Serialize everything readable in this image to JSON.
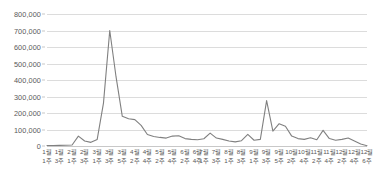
{
  "chart_data": {
    "type": "line",
    "title": "",
    "subtitle": "",
    "xlabel": "",
    "ylabel": "",
    "ylim": [
      0,
      800000
    ],
    "y_ticks": [
      0,
      100000,
      200000,
      300000,
      400000,
      500000,
      600000,
      700000,
      800000
    ],
    "y_tick_labels": [
      "0",
      "100,000",
      "200,000",
      "300,000",
      "400,000",
      "500,000",
      "600,000",
      "700,000",
      "800,000"
    ],
    "grid": true,
    "legend": "none",
    "line_color": "#808080",
    "grid_color": "#dcdcdc",
    "background_color": "#ffffff",
    "text_color": "#595959",
    "categories": [
      "1월 1주",
      "1월 2주",
      "1월 3주",
      "1월 4주",
      "2월 1주",
      "2월 2주",
      "2월 3주",
      "2월 4주",
      "3월 1주",
      "3월 2주",
      "3월 3주",
      "3월 4주",
      "3월 5주",
      "4월 1주",
      "4월 2주",
      "4월 3주",
      "4월 4주",
      "5월 1주",
      "5월 2주",
      "5월 3주",
      "5월 4주",
      "6월 1주",
      "6월 2주",
      "6월 3주",
      "6월 4주",
      "7월 1주",
      "7월 2주",
      "7월 3주",
      "7월 4주",
      "8월 1주",
      "8월 2주",
      "8월 3주",
      "8월 4주",
      "9월 1주",
      "9월 2주",
      "9월 3주",
      "9월 4주",
      "9월 5주",
      "10월 1주",
      "10월 2주",
      "10월 3주",
      "10월 4주",
      "11월 1주",
      "11월 2주",
      "11월 3주",
      "11월 4주",
      "12월 1주",
      "12월 2주",
      "12월 3주",
      "12월 4주",
      "12월 5주",
      "12월 6주"
    ],
    "x_tick_labels": [
      {
        "month": "1월",
        "week": "1주",
        "index": 0
      },
      {
        "month": "1월",
        "week": "3주",
        "index": 2
      },
      {
        "month": "2월",
        "week": "1주",
        "index": 4
      },
      {
        "month": "2월",
        "week": "3주",
        "index": 6
      },
      {
        "month": "3월",
        "week": "1주",
        "index": 8
      },
      {
        "month": "3월",
        "week": "3주",
        "index": 10
      },
      {
        "month": "3월",
        "week": "5주",
        "index": 12
      },
      {
        "month": "4월",
        "week": "2주",
        "index": 14
      },
      {
        "month": "4월",
        "week": "4주",
        "index": 16
      },
      {
        "month": "5월",
        "week": "2주",
        "index": 18
      },
      {
        "month": "5월",
        "week": "4주",
        "index": 20
      },
      {
        "month": "6월",
        "week": "2주",
        "index": 22
      },
      {
        "month": "6월",
        "week": "4주",
        "index": 24
      },
      {
        "month": "7월",
        "week": "1주",
        "index": 25
      },
      {
        "month": "7월",
        "week": "3주",
        "index": 27
      },
      {
        "month": "8월",
        "week": "1주",
        "index": 29
      },
      {
        "month": "8월",
        "week": "3주",
        "index": 31
      },
      {
        "month": "9월",
        "week": "1주",
        "index": 33
      },
      {
        "month": "9월",
        "week": "3주",
        "index": 35
      },
      {
        "month": "9월",
        "week": "5주",
        "index": 37
      },
      {
        "month": "10월",
        "week": "2주",
        "index": 39
      },
      {
        "month": "10월",
        "week": "4주",
        "index": 41
      },
      {
        "month": "11월",
        "week": "2주",
        "index": 43
      },
      {
        "month": "11월",
        "week": "4주",
        "index": 45
      },
      {
        "month": "12월",
        "week": "2주",
        "index": 47
      },
      {
        "month": "12월",
        "week": "4주",
        "index": 49
      },
      {
        "month": "12월",
        "week": "6주",
        "index": 51
      }
    ],
    "series": [
      {
        "name": "주간 추이",
        "values": [
          3000,
          3000,
          4000,
          5000,
          6000,
          60000,
          30000,
          22000,
          40000,
          260000,
          700000,
          420000,
          180000,
          165000,
          160000,
          125000,
          70000,
          58000,
          52000,
          48000,
          60000,
          62000,
          45000,
          40000,
          38000,
          44000,
          78000,
          48000,
          40000,
          30000,
          25000,
          32000,
          70000,
          35000,
          40000,
          275000,
          90000,
          135000,
          120000,
          60000,
          45000,
          40000,
          50000,
          38000,
          95000,
          45000,
          35000,
          40000,
          48000,
          30000,
          12000,
          2000
        ]
      }
    ]
  }
}
